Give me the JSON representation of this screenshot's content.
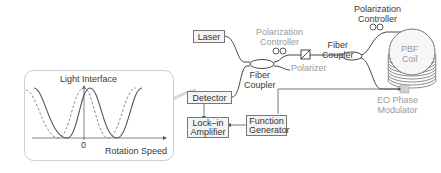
{
  "diagram": {
    "title": "",
    "components": {
      "laser": "Laser",
      "detector": "Detector",
      "fiber_coupler_1": "Fiber Coupler",
      "polarization_controller_1": "Polarization Controller",
      "polarizer": "Polarizer",
      "fiber_coupler_2": "Fiber Coupler",
      "polarization_controller_2": "Polarization Controller",
      "pbf_coil": "PBF Coil",
      "eo_phase_modulator": "EO Phase Modulator",
      "lock_in_amplifier": "Lock–in Amplifier",
      "function_generator": "Function Generator"
    },
    "labels": {
      "fc1_line1": "Fiber",
      "fc1_line2": "Coupler",
      "pc1_line1": "Polarization",
      "pc1_line2": "Controller",
      "fc2_line1": "Fiber",
      "fc2_line2": "Coupler",
      "pc2_line1": "Polarization",
      "pc2_line2": "Controller",
      "coil_line1": "PBF",
      "coil_line2": "Coil",
      "eo_line1": "EO Phase",
      "eo_line2": "Modulator",
      "lia_line1": "Lock–in",
      "lia_line2": "Amplifier",
      "fg_line1": "Function",
      "fg_line2": "Generator"
    },
    "inset": {
      "y_label": "Light Interface",
      "x_label": "Rotation Speed",
      "origin_label": "0",
      "series": [
        "solid",
        "dashed"
      ]
    },
    "connections": [
      [
        "Laser",
        "Fiber Coupler"
      ],
      [
        "Detector",
        "Fiber Coupler"
      ],
      [
        "Fiber Coupler",
        "Polarization Controller"
      ],
      [
        "Polarization Controller",
        "Polarizer"
      ],
      [
        "Polarizer",
        "Fiber Coupler (2)"
      ],
      [
        "Fiber Coupler (2)",
        "Polarization Controller (2)"
      ],
      [
        "Polarization Controller (2)",
        "PBF Coil"
      ],
      [
        "Fiber Coupler (2)",
        "EO Phase Modulator"
      ],
      [
        "EO Phase Modulator",
        "PBF Coil"
      ],
      [
        "Detector",
        "Lock–in Amplifier"
      ],
      [
        "Function Generator",
        "Lock–in Amplifier"
      ],
      [
        "Function Generator",
        "EO Phase Modulator"
      ],
      [
        "Detector",
        "Inset plot"
      ]
    ]
  }
}
